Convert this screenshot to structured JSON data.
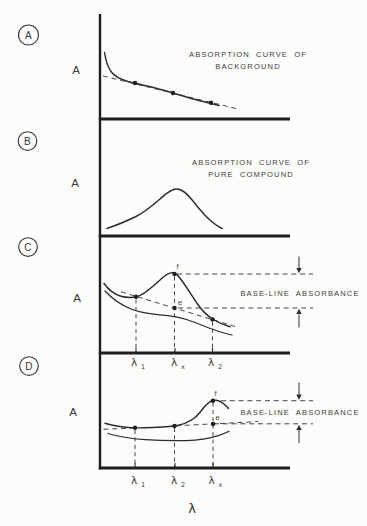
{
  "figure": {
    "colors": {
      "ink": "#2c2c2c",
      "background": "#fcfcfa"
    },
    "x_axis_label": "λ",
    "panels": {
      "a": {
        "badge": "A",
        "y_label": "A",
        "annotation_line1": "ABSORPTION CURVE OF",
        "annotation_line2": "BACKGROUND"
      },
      "b": {
        "badge": "B",
        "y_label": "A",
        "annotation_line1": "ABSORPTION CURVE OF",
        "annotation_line2": "PURE COMPOUND"
      },
      "c": {
        "badge": "C",
        "y_label": "A",
        "annotation": "BASE-LINE ABSORBANCE",
        "point_f": "f",
        "point_e": "e",
        "ticks": [
          {
            "base": "λ",
            "sub": "1"
          },
          {
            "base": "λ",
            "sub": "x"
          },
          {
            "base": "λ",
            "sub": "2"
          }
        ]
      },
      "d": {
        "badge": "D",
        "y_label": "A",
        "annotation": "BASE-LINE ABSORBANCE",
        "point_f": "f",
        "point_e": "e",
        "ticks": [
          {
            "base": "λ",
            "sub": "1"
          },
          {
            "base": "λ",
            "sub": "2"
          },
          {
            "base": "λ",
            "sub": "x"
          }
        ]
      }
    }
  }
}
